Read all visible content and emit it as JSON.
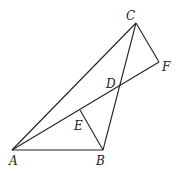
{
  "figure": {
    "type": "geometry-diagram",
    "points": {
      "A": {
        "label": "A",
        "x": 12,
        "y": 150,
        "lx": 9,
        "ly": 165
      },
      "B": {
        "label": "B",
        "x": 103,
        "y": 150,
        "lx": 96,
        "ly": 165
      },
      "C": {
        "label": "C",
        "x": 136,
        "y": 23,
        "lx": 126,
        "ly": 20
      },
      "D": {
        "label": "D",
        "x": 119,
        "y": 87,
        "lx": 106,
        "ly": 88
      },
      "E": {
        "label": "E",
        "x": 80,
        "y": 110,
        "lx": 74,
        "ly": 130
      },
      "F": {
        "label": "F",
        "x": 159,
        "y": 62,
        "lx": 162,
        "ly": 71
      }
    },
    "segments": [
      [
        "A",
        "C"
      ],
      [
        "A",
        "B"
      ],
      [
        "A",
        "F"
      ],
      [
        "C",
        "B"
      ],
      [
        "C",
        "F"
      ],
      [
        "E",
        "B"
      ]
    ]
  }
}
